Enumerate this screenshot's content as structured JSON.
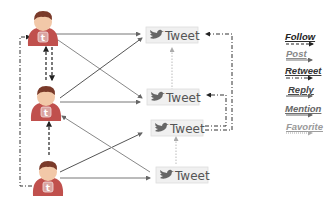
{
  "diagram": {
    "users": [
      {
        "id": "user-1",
        "icon": "twitter-user-icon"
      },
      {
        "id": "user-2",
        "icon": "twitter-user-icon"
      },
      {
        "id": "user-3",
        "icon": "twitter-user-icon"
      }
    ],
    "tweets": [
      {
        "id": "tweet-1",
        "label": "Tweet",
        "icon": "twitter-bird-icon"
      },
      {
        "id": "tweet-2",
        "label": "Tweet",
        "icon": "twitter-bird-icon"
      },
      {
        "id": "tweet-3",
        "label": "Tweet",
        "icon": "twitter-bird-icon"
      },
      {
        "id": "tweet-4",
        "label": "Tweet",
        "icon": "twitter-bird-icon"
      }
    ],
    "legend": [
      {
        "label": "Follow",
        "style": "dashed",
        "color": "#222222"
      },
      {
        "label": "Post",
        "style": "solid",
        "color": "#777777"
      },
      {
        "label": "Retweet",
        "style": "dash-dot",
        "color": "#333333"
      },
      {
        "label": "Reply",
        "style": "solid",
        "color": "#555555"
      },
      {
        "label": "Mention",
        "style": "solid",
        "color": "#666666"
      },
      {
        "label": "Favorite",
        "style": "dotted",
        "color": "#999999"
      }
    ],
    "colors": {
      "user_body": "#c0504d",
      "user_head": "#f2c8a8",
      "user_hair": "#7a3a2a",
      "tweet_box_bg": "#f0f0f0",
      "tweet_box_border": "#cccccc"
    }
  }
}
